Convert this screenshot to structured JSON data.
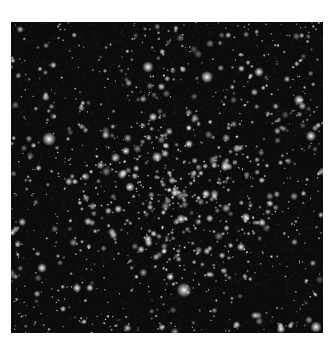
{
  "image": {
    "subject": "star cluster field",
    "background_color": "#0c0c0c",
    "star_color": "#ffffff",
    "frame": {
      "x": 11,
      "y": 22,
      "width": 312,
      "height": 311
    },
    "cluster_center": {
      "x": 165,
      "y": 175
    },
    "bright_stars": [
      {
        "x": 38,
        "y": 117,
        "r": 3.2
      },
      {
        "x": 137,
        "y": 45,
        "r": 2.6
      },
      {
        "x": 146,
        "y": 135,
        "r": 2.4
      },
      {
        "x": 170,
        "y": 197,
        "r": 2.2
      },
      {
        "x": 196,
        "y": 55,
        "r": 2.8
      },
      {
        "x": 173,
        "y": 268,
        "r": 3.4
      },
      {
        "x": 248,
        "y": 50,
        "r": 2.2
      },
      {
        "x": 288,
        "y": 78,
        "r": 2.4
      },
      {
        "x": 300,
        "y": 114,
        "r": 2.4
      },
      {
        "x": 31,
        "y": 246,
        "r": 2.2
      },
      {
        "x": 66,
        "y": 266,
        "r": 2.0
      },
      {
        "x": 119,
        "y": 165,
        "r": 2.2
      },
      {
        "x": 214,
        "y": 145,
        "r": 2.0
      },
      {
        "x": 305,
        "y": 305,
        "r": 2.6
      },
      {
        "x": 270,
        "y": 307,
        "r": 2.0
      },
      {
        "x": 142,
        "y": 95,
        "r": 2.0
      },
      {
        "x": 178,
        "y": 122,
        "r": 1.9
      },
      {
        "x": 230,
        "y": 225,
        "r": 1.9
      },
      {
        "x": 137,
        "y": 217,
        "r": 1.9
      },
      {
        "x": 195,
        "y": 172,
        "r": 2.0
      }
    ],
    "field_star_count": 900,
    "cluster_star_count": 260
  }
}
